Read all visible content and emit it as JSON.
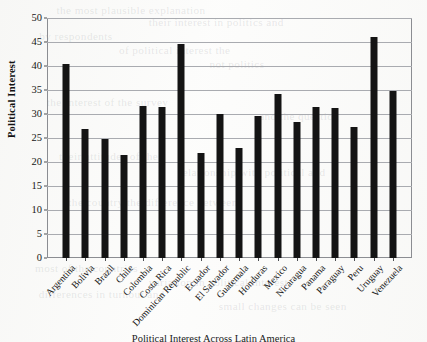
{
  "chart_data": {
    "type": "bar",
    "title": "",
    "caption": "Political Interest Across Latin America",
    "xlabel": "",
    "ylabel": "Political Interest",
    "ylim": [
      0,
      50
    ],
    "yticks": [
      0,
      5,
      10,
      15,
      20,
      25,
      30,
      35,
      40,
      45,
      50
    ],
    "grid": true,
    "legend": false,
    "bar_color": "#141414",
    "categories": [
      "Argentina",
      "Bolivia",
      "Brazil",
      "Chile",
      "Colombia",
      "Costa Rica",
      "Dominican Republic",
      "Ecuador",
      "El Salvador",
      "Guatemala",
      "Honduras",
      "Mexico",
      "Nicaragua",
      "Panama",
      "Paraguay",
      "Peru",
      "Uruguay",
      "Venezuela"
    ],
    "values": [
      40.4,
      26.9,
      24.7,
      21.4,
      31.6,
      31.4,
      44.6,
      21.9,
      30.0,
      22.9,
      29.6,
      34.2,
      28.3,
      31.5,
      31.2,
      27.3,
      46.0,
      34.7
    ]
  },
  "bleed_through": [
    "the most plausible explanation",
    "their interest in politics and",
    "by respondents",
    "of political interest the",
    "not politics",
    "the interest of the survey",
    "and the question",
    "their attitudes of the",
    "relationship with political and",
    "the country the difference between",
    "most of the countries",
    "variation in political interest",
    "differences in turnout and",
    "small changes can be seen"
  ]
}
